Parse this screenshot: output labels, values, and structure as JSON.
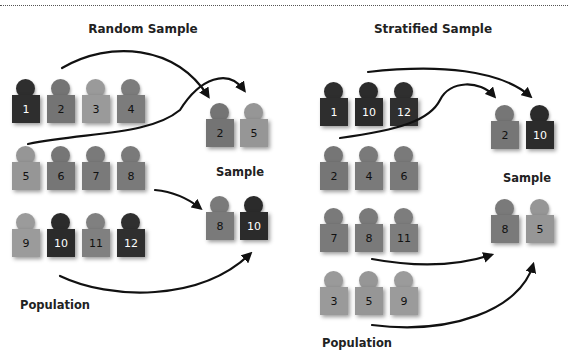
{
  "colors": {
    "c1": "#2e2e2e",
    "c2": "#717171",
    "c3": "#9a9a9a",
    "c4": "#7e7e7e",
    "c5": "#959595",
    "c6": "#757575",
    "c7": "#7a7a7a",
    "c8": "#797979",
    "c9": "#9b9b9b",
    "c10": "#2b2b2b",
    "c11": "#808080",
    "c12": "#2f2f2f"
  },
  "random": {
    "title": "Random Sample",
    "population_label": "Population",
    "sample_label": "Sample",
    "population": [
      {
        "n": "1",
        "shade": "dark"
      },
      {
        "n": "2",
        "shade": "mid"
      },
      {
        "n": "3",
        "shade": "light"
      },
      {
        "n": "4",
        "shade": "mid"
      },
      {
        "n": "5",
        "shade": "light"
      },
      {
        "n": "6",
        "shade": "mid"
      },
      {
        "n": "7",
        "shade": "mid"
      },
      {
        "n": "8",
        "shade": "mid"
      },
      {
        "n": "9",
        "shade": "light"
      },
      {
        "n": "10",
        "shade": "dark"
      },
      {
        "n": "11",
        "shade": "mid"
      },
      {
        "n": "12",
        "shade": "dark"
      }
    ],
    "sample": [
      {
        "n": "2",
        "shade": "mid"
      },
      {
        "n": "5",
        "shade": "light"
      },
      {
        "n": "8",
        "shade": "mid"
      },
      {
        "n": "10",
        "shade": "dark"
      }
    ]
  },
  "stratified": {
    "title": "Stratified Sample",
    "population_label": "Population",
    "sample_label": "Sample",
    "strata": [
      [
        {
          "n": "1",
          "shade": "dark"
        },
        {
          "n": "10",
          "shade": "dark"
        },
        {
          "n": "12",
          "shade": "dark"
        }
      ],
      [
        {
          "n": "2",
          "shade": "mid"
        },
        {
          "n": "4",
          "shade": "mid"
        },
        {
          "n": "6",
          "shade": "mid"
        }
      ],
      [
        {
          "n": "7",
          "shade": "mid"
        },
        {
          "n": "8",
          "shade": "mid"
        },
        {
          "n": "11",
          "shade": "mid"
        }
      ],
      [
        {
          "n": "3",
          "shade": "light"
        },
        {
          "n": "5",
          "shade": "light"
        },
        {
          "n": "9",
          "shade": "light"
        }
      ]
    ],
    "sample": [
      {
        "n": "2",
        "shade": "mid"
      },
      {
        "n": "10",
        "shade": "dark"
      },
      {
        "n": "8",
        "shade": "mid"
      },
      {
        "n": "5",
        "shade": "light"
      }
    ]
  }
}
